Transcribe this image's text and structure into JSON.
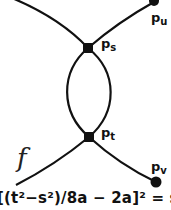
{
  "diagram": {
    "nodes": [
      {
        "id": "p_s",
        "label": "p",
        "subscript": "s",
        "x": 88,
        "y": 48
      },
      {
        "id": "p_t",
        "label": "p",
        "subscript": "t",
        "x": 89,
        "y": 137
      },
      {
        "id": "p_u",
        "label": "p",
        "subscript": "u",
        "x": 154,
        "y": 1
      },
      {
        "id": "p_v",
        "label": "p",
        "subscript": "v",
        "x": 156,
        "y": 182
      }
    ],
    "edges": [
      {
        "from": "upper-left-edge",
        "to": "p_s"
      },
      {
        "from": "p_s",
        "to": "p_u"
      },
      {
        "from": "p_s",
        "to": "p_t",
        "side": "left"
      },
      {
        "from": "p_s",
        "to": "p_t",
        "side": "right"
      },
      {
        "from": "p_t",
        "to": "lower-left-edge"
      },
      {
        "from": "p_t",
        "to": "p_v"
      }
    ],
    "function_label": "f",
    "formula_text": "[(t²−s²)/8a − 2a]² = s²−"
  },
  "labels": {
    "p_s": {
      "main": "p",
      "sub": "s"
    },
    "p_t": {
      "main": "p",
      "sub": "t"
    },
    "p_u": {
      "main": "p",
      "sub": "u"
    },
    "p_v": {
      "main": "p",
      "sub": "v"
    }
  },
  "colors": {
    "line": "#111111",
    "background": "#ffffff"
  }
}
